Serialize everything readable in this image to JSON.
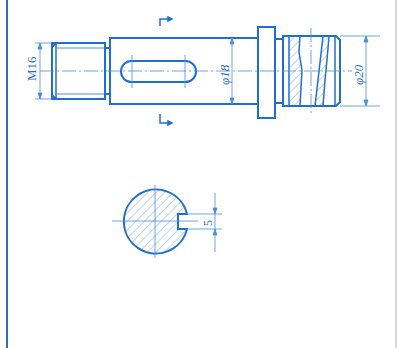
{
  "drawing": {
    "type": "engineering-shaft-drawing",
    "colors": {
      "line": "#1f6fd1",
      "thin": "#4a8ee0",
      "hatch": "#7aa9e6",
      "frame_left": "#2a6fc9",
      "frame_right": "#c9ced6",
      "background": "#ffffff"
    },
    "dimensions": {
      "thread": "M16",
      "body_diameter": "φ18",
      "end_diameter": "φ20",
      "keyway_width": "5"
    },
    "section_marks": {
      "top": "section-mark-top",
      "bottom": "section-mark-bottom"
    }
  }
}
